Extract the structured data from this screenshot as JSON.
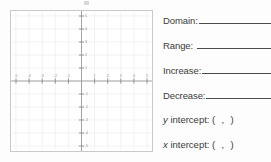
{
  "worksheet": {
    "answers": [
      {
        "id": "domain",
        "label": "Domain:"
      },
      {
        "id": "range",
        "label": "Range:"
      },
      {
        "id": "increase",
        "label": "Increase:"
      },
      {
        "id": "decrease",
        "label": "Decrease:"
      }
    ],
    "intercepts": [
      {
        "id": "y-intercept",
        "var": "y",
        "label": "intercept: (",
        "separator": ",",
        "close": ")"
      },
      {
        "id": "x-intercept",
        "var": "x",
        "label": "intercept: (",
        "separator": ",",
        "close": ")"
      }
    ]
  },
  "chart_data": {
    "type": "scatter",
    "title": "",
    "xlabel": "",
    "ylabel": "",
    "xlim": [
      -5,
      5
    ],
    "ylim": [
      -5,
      5
    ],
    "grid": true,
    "legend": false,
    "axis_color": "#9a9a9a",
    "grid_color": "#ededed",
    "tick_color": "#8a8a8a",
    "x_ticks": [
      -5,
      -4,
      -3,
      -2,
      -1,
      1,
      2,
      3,
      4,
      5
    ],
    "y_ticks": [
      -5,
      -4,
      -3,
      -2,
      -1,
      1,
      2,
      3,
      4,
      5
    ],
    "x_tick_labels": [
      "-5",
      "-4",
      "-3",
      "-2",
      "-1",
      "1",
      "2",
      "3",
      "4",
      "5"
    ],
    "y_tick_labels": [
      "-5",
      "-4",
      "-3",
      "-2",
      "-1",
      "1",
      "2",
      "3",
      "4",
      "5"
    ],
    "series": [
      {
        "name": "data",
        "x": [],
        "y": []
      }
    ]
  }
}
